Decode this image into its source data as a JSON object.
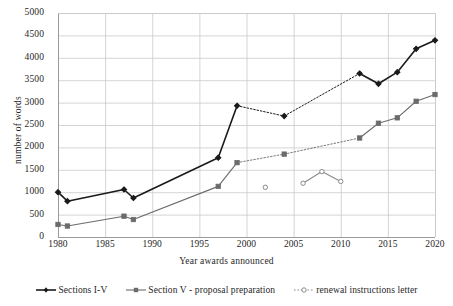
{
  "chart_data": {
    "type": "line",
    "title": "",
    "xlabel": "Year awards announced",
    "ylabel": "number of words",
    "xlim": [
      1980,
      2020
    ],
    "ylim": [
      0,
      5000
    ],
    "xticks": [
      1980,
      1985,
      1990,
      1995,
      2000,
      2005,
      2010,
      2015,
      2020
    ],
    "yticks": [
      0,
      500,
      1000,
      1500,
      2000,
      2500,
      3000,
      3500,
      4000,
      4500,
      5000
    ],
    "grid": true,
    "legend_position": "bottom",
    "series": [
      {
        "name": "Sections I-V",
        "color": "#1a1a1a",
        "marker": "filled-diamond",
        "segments": [
          {
            "style": "solid",
            "points": [
              [
                1980,
                1000
              ],
              [
                1981,
                800
              ],
              [
                1987,
                1060
              ],
              [
                1988,
                870
              ],
              [
                1997,
                1770
              ],
              [
                1999,
                2930
              ]
            ]
          },
          {
            "style": "dotted",
            "points": [
              [
                1999,
                2930
              ],
              [
                2004,
                2700
              ]
            ]
          },
          {
            "style": "dotted",
            "points": [
              [
                2004,
                2700
              ],
              [
                2012,
                3650
              ]
            ]
          },
          {
            "style": "solid",
            "points": [
              [
                2012,
                3650
              ],
              [
                2014,
                3420
              ],
              [
                2016,
                3680
              ],
              [
                2018,
                4200
              ],
              [
                2020,
                4390
              ]
            ]
          }
        ],
        "x": [
          1980,
          1981,
          1987,
          1988,
          1997,
          1999,
          2004,
          2012,
          2014,
          2016,
          2018,
          2020
        ],
        "y": [
          1000,
          800,
          1060,
          870,
          1770,
          2930,
          2700,
          3650,
          3420,
          3680,
          4200,
          4390
        ]
      },
      {
        "name": "Section V - proposal preparation",
        "color": "#6b6b6b",
        "marker": "filled-square",
        "segments": [
          {
            "style": "solid",
            "points": [
              [
                1980,
                280
              ],
              [
                1981,
                245
              ],
              [
                1987,
                465
              ],
              [
                1988,
                390
              ],
              [
                1997,
                1130
              ],
              [
                1999,
                1660
              ]
            ]
          },
          {
            "style": "dotted",
            "points": [
              [
                1999,
                1660
              ],
              [
                2004,
                1850
              ]
            ]
          },
          {
            "style": "dotted",
            "points": [
              [
                2004,
                1850
              ],
              [
                2012,
                2210
              ]
            ]
          },
          {
            "style": "solid",
            "points": [
              [
                2012,
                2210
              ],
              [
                2014,
                2540
              ],
              [
                2016,
                2660
              ],
              [
                2018,
                3030
              ],
              [
                2020,
                3180
              ]
            ]
          }
        ],
        "x": [
          1980,
          1981,
          1987,
          1988,
          1997,
          1999,
          2004,
          2012,
          2014,
          2016,
          2018,
          2020
        ],
        "y": [
          280,
          245,
          465,
          390,
          1130,
          1660,
          1850,
          2210,
          2540,
          2660,
          3030,
          3180
        ]
      },
      {
        "name": "renewal instructions letter",
        "color": "#8a8a8a",
        "marker": "open-circle",
        "segments": [
          {
            "style": "none",
            "points": [
              [
                2002,
                1110
              ]
            ]
          },
          {
            "style": "solid",
            "points": [
              [
                2006,
                1200
              ],
              [
                2008,
                1460
              ],
              [
                2010,
                1240
              ]
            ]
          }
        ],
        "x": [
          2002,
          2006,
          2008,
          2010
        ],
        "y": [
          1110,
          1200,
          1460,
          1240
        ]
      }
    ]
  },
  "axis": {
    "x_title": "Year awards announced",
    "y_title": "number of words",
    "x_tick_labels": [
      "1980",
      "1985",
      "1990",
      "1995",
      "2000",
      "2005",
      "2010",
      "2015",
      "2020"
    ],
    "y_tick_labels": [
      "0",
      "500",
      "1000",
      "1500",
      "2000",
      "2500",
      "3000",
      "3500",
      "4000",
      "4500",
      "5000"
    ]
  },
  "legend": {
    "items": [
      {
        "label": "Sections I-V",
        "color": "#1a1a1a",
        "marker": "filled-diamond"
      },
      {
        "label": "Section V - proposal preparation",
        "color": "#6b6b6b",
        "marker": "filled-square"
      },
      {
        "label": "renewal instructions letter",
        "color": "#8a8a8a",
        "marker": "open-circle"
      }
    ]
  },
  "colors": {
    "series_1": "#1a1a1a",
    "series_2": "#6b6b6b",
    "series_3": "#8a8a8a",
    "grid": "#c9c9c9",
    "axis": "#9a9a9a",
    "background": "#ffffff",
    "text": "#1f1f1f"
  }
}
